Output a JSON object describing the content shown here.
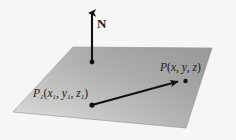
{
  "figure": {
    "background_color": "#f7f6f4",
    "ink_color": "#1a1a1a"
  },
  "plane": {
    "name": "plane",
    "fill_light": "#d8d8d6",
    "fill_mid": "#b0b0ae",
    "fill_dark": "#9a9a98",
    "outline_color": "#8c8c8a",
    "vertices": [
      {
        "x": 73,
        "y": 47
      },
      {
        "x": 212,
        "y": 48
      },
      {
        "x": 186,
        "y": 128
      },
      {
        "x": 13,
        "y": 112
      }
    ]
  },
  "normal_vector": {
    "name": "normal-vector-N",
    "label": "N",
    "base": {
      "x": 92,
      "y": 62
    },
    "tip": {
      "x": 92,
      "y": 10
    },
    "color": "#111111"
  },
  "position_vector": {
    "name": "position-vector",
    "start": {
      "x": 92,
      "y": 105
    },
    "end": {
      "x": 181,
      "y": 81
    },
    "color": "#111111"
  },
  "points": [
    {
      "id": "P1",
      "name": "point-P1",
      "label_prefix": "P",
      "label_sub": "1",
      "coords": [
        "x",
        "y",
        "z"
      ],
      "coord_subs": [
        "1",
        "1",
        "1"
      ],
      "label_text": "P1(x1, y1, z1)",
      "x": 92,
      "y": 105
    },
    {
      "id": "P",
      "name": "point-P",
      "label_prefix": "P",
      "label_sub": "",
      "coords": [
        "x",
        "y",
        "z"
      ],
      "coord_subs": [
        "",
        "",
        ""
      ],
      "label_text": "P(x, y, z)",
      "x": 185,
      "y": 81
    }
  ]
}
